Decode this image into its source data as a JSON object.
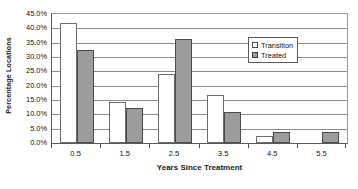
{
  "chart_data": {
    "type": "bar",
    "title": "",
    "xlabel": "Years Since Treatment",
    "ylabel": "Percentage Locations",
    "categories": [
      "0.5",
      "1.5",
      "2.5",
      "3.5",
      "4.5",
      "5.5"
    ],
    "series": [
      {
        "name": "Transition",
        "values": [
          41.7,
          14.3,
          24.0,
          16.7,
          2.5,
          0.0
        ],
        "color": "#ffffff"
      },
      {
        "name": "Treated",
        "values": [
          32.4,
          12.2,
          36.3,
          10.8,
          4.0,
          3.8
        ],
        "color": "#9c9c9c"
      }
    ],
    "ylim": [
      0,
      45
    ],
    "ytick_values": [
      0,
      5,
      10,
      15,
      20,
      25,
      30,
      35,
      40,
      45
    ],
    "ytick_labels": [
      "0.0%",
      "5.0%",
      "10.0%",
      "15.0%",
      "20.0%",
      "25.0%",
      "30.0%",
      "35.0%",
      "40.0%",
      "45.0%"
    ],
    "grid": true,
    "legend_position": "upper-right-inside"
  },
  "legend": {
    "entries": [
      {
        "label": "Transition"
      },
      {
        "label": "Treated"
      }
    ]
  },
  "axes": {
    "y_title": "Percentage Locations",
    "x_title": "Years Since Treatment"
  }
}
